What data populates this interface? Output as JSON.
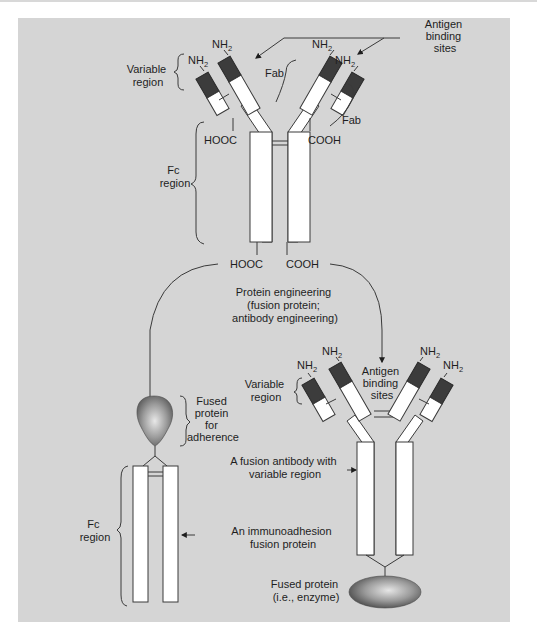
{
  "figure": {
    "top_antibody": {
      "antigen_binding_label": [
        "Antigen",
        "binding",
        "sites"
      ],
      "variable_region_label": [
        "Variable",
        "region"
      ],
      "fab_labels": [
        "Fab",
        "Fab"
      ],
      "fc_region_label": [
        "Fc",
        "region"
      ],
      "nh2": "NH",
      "nh2_sub": "2",
      "hooc_upper": "HOOC",
      "cooh_upper": "COOH",
      "hooc_lower": "HOOC",
      "cooh_lower": "COOH"
    },
    "process": {
      "label": [
        "Protein engineering",
        "(fusion protein;",
        "antibody engineering)"
      ]
    },
    "immunoadhesion": {
      "fused_protein_label": [
        "Fused",
        "protein",
        "for",
        "adherence"
      ],
      "fc_region_label": [
        "Fc",
        "region"
      ],
      "description": [
        "An immunoadhesion",
        "fusion protein"
      ]
    },
    "fusion_antibody": {
      "variable_region_label": [
        "Variable",
        "region"
      ],
      "antigen_binding_label": [
        "Antigen",
        "binding",
        "sites"
      ],
      "description": [
        "A fusion antibody with",
        "variable region"
      ],
      "fused_protein_label": [
        "Fused protein",
        "(i.e., enzyme)"
      ],
      "nh2": "NH",
      "nh2_sub": "2"
    },
    "colors": {
      "panel": "#d5d5d5",
      "variable_domain": "#3c3c3c",
      "chain": "#ffffff",
      "fused_protein": "#5a5a5a"
    }
  }
}
